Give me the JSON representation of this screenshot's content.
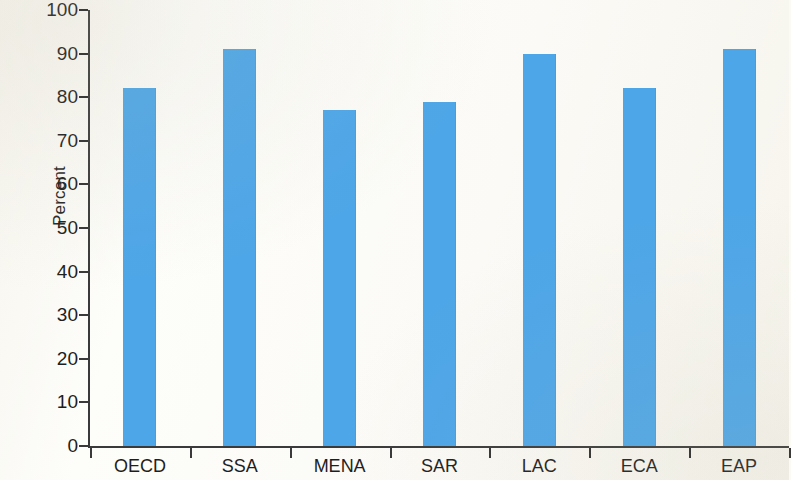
{
  "chart_data": {
    "type": "bar",
    "title": "",
    "subtitle": "",
    "xlabel": "",
    "ylabel": "Percent",
    "categories": [
      "OECD",
      "SSA",
      "MENA",
      "SAR",
      "LAC",
      "ECA",
      "EAP"
    ],
    "values": [
      82,
      91,
      77,
      79,
      90,
      82,
      91
    ],
    "ylim": [
      0,
      100
    ],
    "ytick_labels": [
      "100",
      "90",
      "80",
      "70",
      "60",
      "50",
      "40",
      "30",
      "20",
      "10",
      "0"
    ],
    "ytick_values": [
      100,
      90,
      80,
      70,
      60,
      50,
      40,
      30,
      20,
      10,
      0
    ],
    "grid": false,
    "legend": null,
    "annotations": [],
    "bar_color": "#4da6e8",
    "axis_color": "#3a3a3a",
    "background_color": "#fbfaf5"
  }
}
